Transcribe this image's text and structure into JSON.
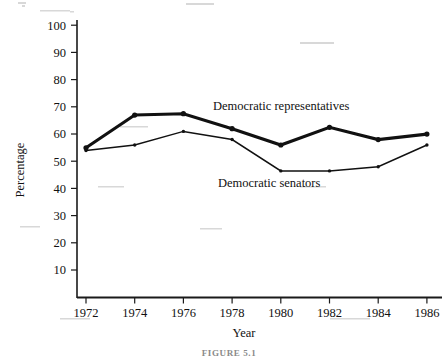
{
  "figure": {
    "caption": "FIGURE 5.1",
    "background_color": "#ffffff",
    "ink_color": "#111111"
  },
  "axes": {
    "y_title": "Percentage",
    "x_title": "Year",
    "y_ticks": [
      "10",
      "20",
      "30",
      "40",
      "50",
      "60",
      "70",
      "80",
      "90",
      "100"
    ],
    "x_ticks": [
      "1972",
      "1974",
      "1976",
      "1978",
      "1980",
      "1982",
      "1984",
      "1986"
    ]
  },
  "annotations": {
    "representatives_label": "Democratic representatives",
    "senators_label": "Democratic senators"
  },
  "chart_data": {
    "type": "line",
    "title": "",
    "subtitle": "",
    "xlabel": "Year",
    "ylabel": "Percentage",
    "x": [
      1972,
      1974,
      1976,
      1978,
      1980,
      1982,
      1984,
      1986
    ],
    "categories": [
      "1972",
      "1974",
      "1976",
      "1978",
      "1980",
      "1982",
      "1984",
      "1986"
    ],
    "series": [
      {
        "name": "Democratic representatives",
        "values": [
          55,
          67,
          67.5,
          62,
          56,
          62.5,
          58,
          60
        ],
        "line_weight": "bold",
        "color": "#111111"
      },
      {
        "name": "Democratic senators",
        "values": [
          54,
          56,
          61,
          58,
          46.5,
          46.5,
          48,
          56
        ],
        "line_weight": "thin",
        "color": "#111111"
      }
    ],
    "xlim": [
      1972,
      1986
    ],
    "ylim": [
      0,
      100
    ],
    "y_tick_step": 10,
    "x_tick_step": 2,
    "grid": false,
    "legend": "inline-annotations",
    "legend_position": "plot-area"
  }
}
